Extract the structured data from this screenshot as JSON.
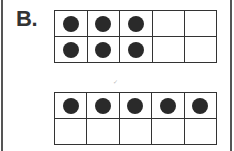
{
  "label": "B.",
  "ten_frames": [
    {
      "name": "ten-frame-1",
      "rows": [
        [
          true,
          true,
          true,
          false,
          false
        ],
        [
          true,
          true,
          true,
          false,
          false
        ]
      ],
      "count": 6
    },
    {
      "name": "ten-frame-2",
      "rows": [
        [
          true,
          true,
          true,
          true,
          true
        ],
        [
          false,
          false,
          false,
          false,
          false
        ]
      ],
      "count": 5
    }
  ],
  "mark": "✓",
  "colors": {
    "dot": "#2a2a2a",
    "grid": "#333333",
    "border": "#555555"
  }
}
